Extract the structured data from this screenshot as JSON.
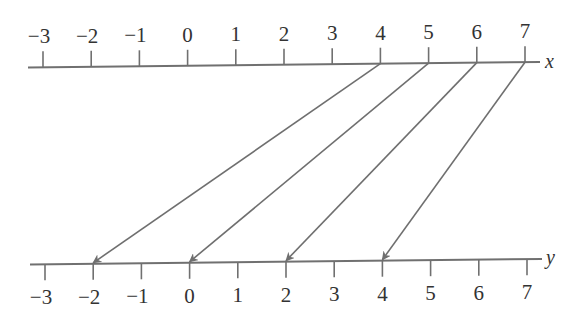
{
  "diagram": {
    "type": "mapping-diagram",
    "top_axis": {
      "label": "x",
      "ticks": [
        "−3",
        "−2",
        "−1",
        "0",
        "1",
        "2",
        "3",
        "4",
        "5",
        "6",
        "7"
      ],
      "values": [
        -3,
        -2,
        -1,
        0,
        1,
        2,
        3,
        4,
        5,
        6,
        7
      ]
    },
    "bottom_axis": {
      "label": "y",
      "ticks": [
        "−3",
        "−2",
        "−1",
        "0",
        "1",
        "2",
        "3",
        "4",
        "5",
        "6",
        "7"
      ],
      "values": [
        -3,
        -2,
        -1,
        0,
        1,
        2,
        3,
        4,
        5,
        6,
        7
      ]
    },
    "mappings": [
      {
        "from": 4,
        "to": -2
      },
      {
        "from": 5,
        "to": 0
      },
      {
        "from": 6,
        "to": 2
      },
      {
        "from": 7,
        "to": 4
      }
    ],
    "colors": {
      "line": "#707070",
      "text": "#333333"
    }
  }
}
